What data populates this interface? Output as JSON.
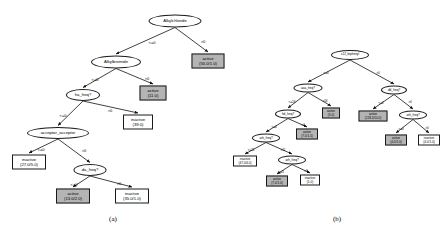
{
  "figure": {
    "captions": [
      {
        "id": "cap-a",
        "text": "(a)",
        "x": 113,
        "y": 219
      },
      {
        "id": "cap-b",
        "text": "(b)",
        "x": 337,
        "y": 219
      }
    ]
  },
  "tree_a": {
    "name": "decision-tree-a",
    "nodes": [
      {
        "id": "a-root",
        "kind": "test",
        "label": "Alkylchloride",
        "x": 175,
        "y": 21,
        "w": 53,
        "h": 13
      },
      {
        "id": "a-alkylbr",
        "kind": "test",
        "label": "Alkylbromide",
        "x": 116,
        "y": 62,
        "w": 50,
        "h": 13
      },
      {
        "id": "a-hafreq",
        "kind": "test",
        "label": "ha_freq?",
        "x": 83,
        "y": 95,
        "w": 34,
        "h": 12
      },
      {
        "id": "a-acceptor",
        "kind": "test",
        "label": "acceptor_acceptor",
        "x": 58,
        "y": 133,
        "w": 62,
        "h": 12
      },
      {
        "id": "a-dafreq",
        "kind": "test",
        "label": "da_freq?",
        "x": 90,
        "y": 170,
        "w": 33,
        "h": 12
      },
      {
        "id": "a-leaf1",
        "kind": "leaf",
        "style": "grey",
        "line1": "active",
        "line2": "(55.0/1.0)",
        "x": 208,
        "y": 61,
        "w": 33,
        "h": 15
      },
      {
        "id": "a-leaf2",
        "kind": "leaf",
        "style": "grey",
        "line1": "active",
        "line2": "(11.0)",
        "x": 153,
        "y": 93,
        "w": 27,
        "h": 15
      },
      {
        "id": "a-leaf3",
        "kind": "leaf",
        "style": "white",
        "line1": "inactive",
        "line2": "(39.0)",
        "x": 138,
        "y": 122,
        "w": 30,
        "h": 15
      },
      {
        "id": "a-leaf4",
        "kind": "leaf",
        "style": "white",
        "line1": "inactive",
        "line2": "(27.0/5.0)",
        "x": 29,
        "y": 162,
        "w": 34,
        "h": 15
      },
      {
        "id": "a-leaf5",
        "kind": "leaf",
        "style": "grey",
        "line1": "active",
        "line2": "(13.0/2.0)",
        "x": 73,
        "y": 196,
        "w": 34,
        "h": 15
      },
      {
        "id": "a-leaf6",
        "kind": "leaf",
        "style": "white",
        "line1": "inactive",
        "line2": "(35.0/1.0)",
        "x": 132,
        "y": 196,
        "w": 34,
        "h": 15
      }
    ],
    "edges": [
      {
        "from": "a-root",
        "to": "a-alkylbr",
        "label": "<=0",
        "lx": 152,
        "ly": 42
      },
      {
        "from": "a-root",
        "to": "a-leaf1",
        "label": ">0",
        "lx": 203,
        "ly": 41
      },
      {
        "from": "a-alkylbr",
        "to": "a-hafreq",
        "label": "<=0",
        "lx": 95,
        "ly": 79
      },
      {
        "from": "a-alkylbr",
        "to": "a-leaf2",
        "label": ">0",
        "lx": 147,
        "ly": 78
      },
      {
        "from": "a-hafreq",
        "to": "a-acceptor",
        "label": "<=0",
        "lx": 63,
        "ly": 115
      },
      {
        "from": "a-hafreq",
        "to": "a-leaf3",
        "label": ">0",
        "lx": 110,
        "ly": 110
      },
      {
        "from": "a-acceptor",
        "to": "a-leaf4",
        "label": "<=0",
        "lx": 41,
        "ly": 149
      },
      {
        "from": "a-acceptor",
        "to": "a-dafreq",
        "label": ">0",
        "lx": 84,
        "ly": 150
      },
      {
        "from": "a-dafreq",
        "to": "a-leaf5",
        "label": "<=0",
        "lx": 74,
        "ly": 184
      },
      {
        "from": "a-dafreq",
        "to": "a-leaf6",
        "label": ">0",
        "lx": 119,
        "ly": 183
      }
    ]
  },
  "tree_b": {
    "name": "decision-tree-b",
    "nodes": [
      {
        "id": "b-root",
        "kind": "test",
        "label": "c12_biphenyl",
        "x": 350,
        "y": 55,
        "w": 38,
        "h": 10
      },
      {
        "id": "b-aaafreq",
        "kind": "test",
        "label": "aaa_freq?",
        "x": 308,
        "y": 88,
        "w": 29,
        "h": 9
      },
      {
        "id": "b-ddfreq",
        "kind": "test",
        "label": "dd_freq?",
        "x": 394,
        "y": 90,
        "w": 26,
        "h": 9
      },
      {
        "id": "b-hdfreq",
        "kind": "test",
        "label": "hd_freq?",
        "x": 288,
        "y": 114,
        "w": 26,
        "h": 9
      },
      {
        "id": "b-arhfreq1",
        "kind": "test",
        "label": "arh_freq?",
        "x": 266,
        "y": 138,
        "w": 28,
        "h": 9
      },
      {
        "id": "b-arhfreq2",
        "kind": "test",
        "label": "arh_freq?",
        "x": 292,
        "y": 160,
        "w": 28,
        "h": 9
      },
      {
        "id": "b-arhfreq3",
        "kind": "test",
        "label": "arh_freq?",
        "x": 413,
        "y": 115,
        "w": 28,
        "h": 9
      },
      {
        "id": "b-bleaf1",
        "kind": "leaf",
        "style": "grey",
        "line1": "active",
        "line2": "(3.0)",
        "x": 331,
        "y": 113,
        "w": 18,
        "h": 11
      },
      {
        "id": "b-bleaf2",
        "kind": "leaf",
        "style": "grey",
        "line1": "active",
        "line2": "(128.0/14.0)",
        "x": 373,
        "y": 116,
        "w": 29,
        "h": 11
      },
      {
        "id": "b-bleaf3",
        "kind": "leaf",
        "style": "grey",
        "line1": "active",
        "line2": "(7.0/1.0)",
        "x": 307,
        "y": 134,
        "w": 22,
        "h": 11
      },
      {
        "id": "b-bleaf4",
        "kind": "leaf",
        "style": "white",
        "line1": "inactive",
        "line2": "(47.0/4.0)",
        "x": 245,
        "y": 161,
        "w": 24,
        "h": 11
      },
      {
        "id": "b-bleaf5",
        "kind": "leaf",
        "style": "grey",
        "line1": "active",
        "line2": "(7.0/1.0)",
        "x": 277,
        "y": 181,
        "w": 22,
        "h": 11
      },
      {
        "id": "b-bleaf6",
        "kind": "leaf",
        "style": "white",
        "line1": "inactive",
        "line2": "(5.0)",
        "x": 310,
        "y": 180,
        "w": 20,
        "h": 11
      },
      {
        "id": "b-bleaf7",
        "kind": "leaf",
        "style": "grey",
        "line1": "active",
        "line2": "(4.0/1.0)",
        "x": 396,
        "y": 140,
        "w": 22,
        "h": 11
      },
      {
        "id": "b-bleaf8",
        "kind": "leaf",
        "style": "white",
        "line1": "inactive",
        "line2": "(4.0/1.0)",
        "x": 429,
        "y": 140,
        "w": 22,
        "h": 11
      }
    ],
    "edges": [
      {
        "from": "b-root",
        "to": "b-aaafreq",
        "label": "<=0",
        "lx": 326,
        "ly": 73
      },
      {
        "from": "b-root",
        "to": "b-ddfreq",
        "label": ">0",
        "lx": 378,
        "ly": 73
      },
      {
        "from": "b-aaafreq",
        "to": "b-hdfreq",
        "label": "<=24",
        "lx": 292,
        "ly": 102
      },
      {
        "from": "b-aaafreq",
        "to": "b-bleaf1",
        "label": ">24",
        "lx": 325,
        "ly": 101
      },
      {
        "from": "b-ddfreq",
        "to": "b-bleaf2",
        "label": "<=2",
        "lx": 381,
        "ly": 103
      },
      {
        "from": "b-ddfreq",
        "to": "b-arhfreq3",
        "label": ">4",
        "lx": 410,
        "ly": 102
      },
      {
        "from": "b-hdfreq",
        "to": "b-arhfreq1",
        "label": "<=4",
        "lx": 274,
        "ly": 127
      },
      {
        "from": "b-hdfreq",
        "to": "b-bleaf3",
        "label": ">4",
        "lx": 303,
        "ly": 125
      },
      {
        "from": "b-arhfreq1",
        "to": "b-bleaf4",
        "label": "<=11",
        "lx": 251,
        "ly": 150
      },
      {
        "from": "b-arhfreq1",
        "to": "b-arhfreq2",
        "label": ">11",
        "lx": 283,
        "ly": 150
      },
      {
        "from": "b-arhfreq2",
        "to": "b-bleaf5",
        "label": "<=3",
        "lx": 281,
        "ly": 172
      },
      {
        "from": "b-arhfreq2",
        "to": "b-bleaf6",
        "label": ">3",
        "lx": 306,
        "ly": 171
      },
      {
        "from": "b-arhfreq3",
        "to": "b-bleaf7",
        "label": "<=0",
        "lx": 401,
        "ly": 129
      },
      {
        "from": "b-arhfreq3",
        "to": "b-bleaf8",
        "label": ">0",
        "lx": 427,
        "ly": 128
      }
    ]
  }
}
